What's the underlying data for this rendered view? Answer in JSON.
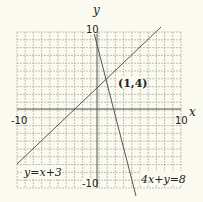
{
  "chart_data": {
    "type": "line",
    "title": "",
    "xlabel": "x",
    "ylabel": "y",
    "xlim": [
      -10,
      10
    ],
    "ylim": [
      -10,
      10
    ],
    "grid": true,
    "x_ticks": [
      "-10",
      "10"
    ],
    "y_ticks": [
      "10",
      "-10"
    ],
    "series": [
      {
        "name": "y=x+3",
        "equation": "y = x + 3",
        "points": [
          [
            -10,
            -7
          ],
          [
            7.5,
            10.5
          ]
        ]
      },
      {
        "name": "4x+y=8",
        "equation": "4x + y = 8",
        "points": [
          [
            -0.5,
            10.3
          ],
          [
            4.8,
            -11.2
          ]
        ]
      }
    ],
    "annotations": [
      {
        "text": "(1,4)",
        "x": 1,
        "y": 4,
        "note": "intersection point"
      }
    ]
  },
  "labels": {
    "x_axis": "x",
    "y_axis": "y",
    "x_min": "-10",
    "x_max": "10",
    "y_max": "10",
    "y_min": "-10",
    "line1": "y=x+3",
    "line2": "4x+y=8",
    "intersection": "(1,4)"
  },
  "colors": {
    "background": "#fbfaf0",
    "grid": "#b0b0a8",
    "axis": "#555555",
    "line": "#555555",
    "text": "#222222"
  }
}
